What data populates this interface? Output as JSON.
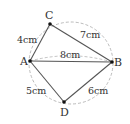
{
  "diagram": {
    "points": [
      {
        "id": "A",
        "label": "A"
      },
      {
        "id": "B",
        "label": "B"
      },
      {
        "id": "C",
        "label": "C"
      },
      {
        "id": "D",
        "label": "D"
      }
    ],
    "segments": [
      {
        "from": "A",
        "to": "C",
        "length": "4cm",
        "style": "solid"
      },
      {
        "from": "C",
        "to": "B",
        "length": "7cm",
        "style": "solid"
      },
      {
        "from": "A",
        "to": "B",
        "length": "8cm",
        "style": "solid"
      },
      {
        "from": "A",
        "to": "D",
        "length": "5cm",
        "style": "solid"
      },
      {
        "from": "D",
        "to": "B",
        "length": "6cm",
        "style": "solid"
      }
    ],
    "circle": {
      "style": "dashed",
      "through": [
        "A",
        "C",
        "B",
        "D"
      ]
    },
    "colors": {
      "line": "#555555",
      "dashed": "#aaaaaa",
      "text": "#333333"
    }
  }
}
